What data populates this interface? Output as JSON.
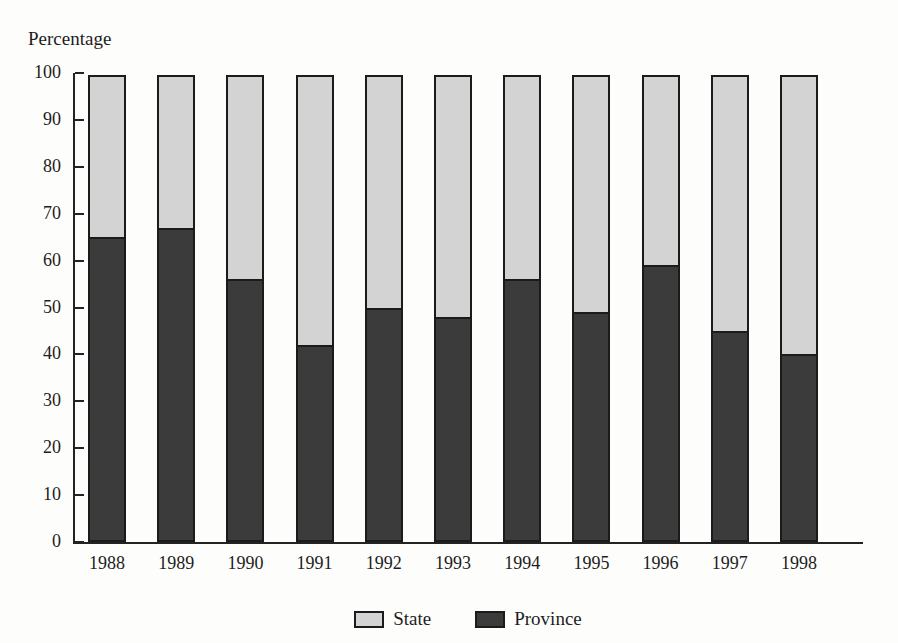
{
  "figure": {
    "axis_title": "Percentage",
    "scan_artifact_text": "",
    "background_color": "#fdfdfc"
  },
  "colors": {
    "state_fill": "#d3d3d3",
    "province_fill": "#3b3b3b",
    "outline": "#1b1b1b",
    "axis": "#232323",
    "text": "#1d1d1d"
  },
  "chart_data": {
    "type": "bar",
    "stacked": true,
    "title": "",
    "xlabel": "",
    "ylabel": "Percentage",
    "ylim": [
      0,
      100
    ],
    "yticks": [
      0,
      10,
      20,
      30,
      40,
      50,
      60,
      70,
      80,
      90,
      100
    ],
    "ytick_labels": [
      "0",
      "10",
      "20",
      "30",
      "40",
      "50",
      "60",
      "70",
      "80",
      "90",
      "100"
    ],
    "grid": false,
    "legend_position": "bottom-center",
    "categories": [
      "1988",
      "1989",
      "1990",
      "1991",
      "1992",
      "1993",
      "1994",
      "1995",
      "1996",
      "1997",
      "1998"
    ],
    "series": [
      {
        "name": "Province",
        "color": "#3b3b3b",
        "values": [
          65,
          67,
          56,
          42,
          50,
          48,
          56,
          49,
          59,
          45,
          40
        ]
      },
      {
        "name": "State",
        "color": "#d3d3d3",
        "values": [
          35,
          33,
          44,
          58,
          50,
          52,
          44,
          51,
          41,
          55,
          60
        ]
      }
    ],
    "legend": [
      "State",
      "Province"
    ]
  }
}
